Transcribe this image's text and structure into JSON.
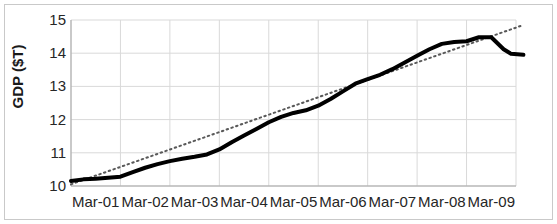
{
  "chart_data": {
    "type": "line",
    "title": "",
    "xlabel": "",
    "ylabel": "GDP ($T)",
    "ylim": [
      10,
      15
    ],
    "yticks": [
      10,
      11,
      12,
      13,
      14,
      15
    ],
    "ytick_labels": [
      "10",
      "11",
      "12",
      "13",
      "14",
      "15"
    ],
    "grid": true,
    "grid_color": "#d9d9d9",
    "legend": "none",
    "categories": [
      "Mar-01",
      "Mar-02",
      "Mar-03",
      "Mar-04",
      "Mar-05",
      "Mar-06",
      "Mar-07",
      "Mar-08",
      "Mar-09"
    ],
    "xtick_labels": [
      "Mar-01",
      "Mar-02",
      "Mar-03",
      "Mar-04",
      "Mar-05",
      "Mar-06",
      "Mar-07",
      "Mar-08",
      "Mar-09"
    ],
    "series": [
      {
        "name": "GDP",
        "style": "solid",
        "color": "#000000",
        "width": 4,
        "x": [
          2001.0,
          2001.25,
          2001.5,
          2001.75,
          2002.0,
          2002.25,
          2002.5,
          2002.75,
          2003.0,
          2003.25,
          2003.5,
          2003.75,
          2004.0,
          2004.25,
          2004.5,
          2004.75,
          2005.0,
          2005.25,
          2005.5,
          2005.75,
          2006.0,
          2006.25,
          2006.5,
          2006.75,
          2007.0,
          2007.25,
          2007.5,
          2007.75,
          2008.0,
          2008.25,
          2008.5,
          2008.75,
          2009.0,
          2009.25,
          2009.5,
          2009.75
        ],
        "values": [
          10.15,
          10.2,
          10.22,
          10.25,
          10.28,
          10.42,
          10.55,
          10.66,
          10.75,
          10.82,
          10.88,
          10.95,
          11.1,
          11.32,
          11.52,
          11.72,
          11.92,
          12.08,
          12.2,
          12.28,
          12.42,
          12.62,
          12.85,
          13.08,
          13.22,
          13.35,
          13.52,
          13.72,
          13.92,
          14.12,
          14.28,
          14.34,
          14.36,
          14.48,
          14.48,
          14.12
        ],
        "tail_x": [
          2009.9,
          2010.15
        ],
        "tail_values": [
          13.98,
          13.95
        ]
      },
      {
        "name": "Trend",
        "style": "dotted",
        "color": "#595959",
        "width": 2,
        "x": [
          2001.0,
          2010.15
        ],
        "values": [
          10.05,
          14.85
        ]
      }
    ],
    "annotations": []
  },
  "axes": {
    "plot_left_px": 71,
    "plot_right_px": 516,
    "plot_top_px": 20,
    "plot_bottom_px": 186
  },
  "colors": {
    "background": "#ffffff",
    "frame": "#c9c9c9",
    "axis": "#a6a6a6",
    "gridline": "#d9d9d9",
    "text": "#262626",
    "series_main": "#000000",
    "series_trend": "#595959"
  }
}
